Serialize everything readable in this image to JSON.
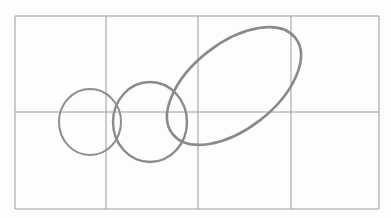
{
  "figure": {
    "background_color": "#fdfdfc",
    "grid": {
      "name": "ruled-rectangle-grid",
      "stroke_color": "#9b9b9b",
      "stroke_width": 1,
      "columns": 4,
      "rows": 2,
      "bounds": {
        "x": 15,
        "y": 16,
        "width": 364,
        "height": 193
      },
      "vertical_line_x": [
        15,
        106,
        198,
        291,
        379
      ],
      "horizontal_line_y": [
        16,
        112,
        209
      ]
    },
    "shapes": [
      {
        "name": "small-circle",
        "type": "ellipse",
        "cx": 90,
        "cy": 122,
        "rx": 31,
        "ry": 33,
        "rotation": 0,
        "stroke_color": "#8d8d8d",
        "stroke_width": 2
      },
      {
        "name": "medium-circle",
        "type": "ellipse",
        "cx": 150,
        "cy": 122,
        "rx": 37,
        "ry": 40,
        "rotation": 0,
        "stroke_color": "#8a8a8a",
        "stroke_width": 2.4
      },
      {
        "name": "large-tilted-ellipse",
        "type": "ellipse",
        "cx": 234,
        "cy": 86,
        "rx": 78,
        "ry": 43,
        "rotation": -38,
        "stroke_color": "#8a8a8a",
        "stroke_width": 2.6
      }
    ]
  }
}
